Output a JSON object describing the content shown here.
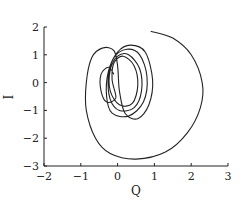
{
  "chart_data": {
    "type": "line",
    "title": "",
    "xlabel": "Q",
    "ylabel": "I",
    "xlim": [
      -2,
      3
    ],
    "ylim": [
      -3,
      2
    ],
    "xticks": [
      -2,
      -1,
      0,
      1,
      2,
      3
    ],
    "yticks": [
      2,
      1,
      0,
      -1,
      -2,
      -3
    ],
    "xtick_labels": [
      "−2",
      "−1",
      "0",
      "1",
      "2",
      "3"
    ],
    "ytick_labels": [
      "2",
      "1",
      "0",
      "−1",
      "−2",
      "−3"
    ],
    "grid": false,
    "legend": null,
    "line_color": "#222222",
    "series": [
      {
        "name": "phase trajectory (Q, I)",
        "description": "Spiral trajectory starting near (0.9, 1.9), sweeping clockwise outward to the right (Q≈2.3) and bottom (I≈-2.8), then converging into nested ellipses around (0.1, 0)",
        "points": [
          [
            0.9,
            1.85
          ],
          [
            1.5,
            1.6
          ],
          [
            2.0,
            1.0
          ],
          [
            2.3,
            0.0
          ],
          [
            2.25,
            -0.9
          ],
          [
            1.9,
            -1.8
          ],
          [
            1.3,
            -2.5
          ],
          [
            0.5,
            -2.75
          ],
          [
            -0.2,
            -2.55
          ],
          [
            -0.6,
            -2.0
          ],
          [
            -0.85,
            -1.0
          ],
          [
            -0.85,
            0.0
          ],
          [
            -0.7,
            0.9
          ],
          [
            -0.4,
            1.25
          ],
          [
            -0.1,
            1.15
          ],
          [
            0.0,
            0.6
          ],
          [
            0.05,
            -0.3
          ],
          [
            0.2,
            -1.1
          ],
          [
            0.55,
            -1.3
          ],
          [
            0.85,
            -0.8
          ],
          [
            0.95,
            0.1
          ],
          [
            0.75,
            1.1
          ],
          [
            0.35,
            1.35
          ],
          [
            0.0,
            1.1
          ],
          [
            -0.25,
            0.4
          ],
          [
            -0.3,
            -0.5
          ],
          [
            -0.15,
            -1.1
          ],
          [
            0.3,
            -1.2
          ],
          [
            0.7,
            -0.7
          ],
          [
            0.8,
            0.2
          ],
          [
            0.6,
            1.0
          ],
          [
            0.25,
            1.2
          ],
          [
            -0.1,
            0.9
          ],
          [
            -0.25,
            0.2
          ],
          [
            -0.2,
            -0.6
          ],
          [
            0.05,
            -1.0
          ],
          [
            0.45,
            -0.9
          ],
          [
            0.65,
            -0.3
          ],
          [
            0.6,
            0.5
          ],
          [
            0.3,
            1.0
          ],
          [
            0.0,
            0.95
          ],
          [
            -0.2,
            0.45
          ],
          [
            -0.2,
            -0.3
          ],
          [
            0.05,
            -0.8
          ],
          [
            0.4,
            -0.75
          ],
          [
            0.55,
            -0.1
          ],
          [
            0.45,
            0.6
          ],
          [
            0.15,
            0.95
          ],
          [
            -0.1,
            0.7
          ],
          [
            -0.15,
            0.1
          ],
          [
            -0.05,
            -0.55
          ],
          [
            -0.3,
            -0.7
          ],
          [
            -0.45,
            -0.3
          ],
          [
            -0.45,
            0.3
          ],
          [
            -0.25,
            0.55
          ],
          [
            -0.1,
            0.3
          ]
        ]
      }
    ]
  }
}
